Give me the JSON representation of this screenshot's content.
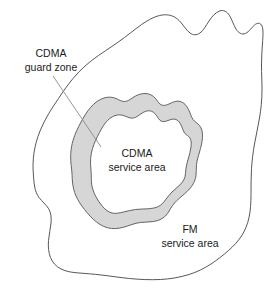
{
  "diagram": {
    "type": "concentric-region-map",
    "colors": {
      "background": "#ffffff",
      "outline_stroke": "#444444",
      "guard_zone_fill": "#d6d6d6",
      "guard_zone_stroke": "#555555",
      "service_area_fill": "#ffffff",
      "leader_line": "#888888",
      "text": "#1a1a1a"
    },
    "labels": {
      "guard_zone": {
        "line1": "CDMA",
        "line2": "guard zone"
      },
      "cdma_service_area": {
        "line1": "CDMA",
        "line2": "service area"
      },
      "fm_service_area": {
        "line1": "FM",
        "line2": "service area"
      }
    },
    "regions": [
      {
        "name": "fm-service-area",
        "label": "FM service area",
        "fill": "#ffffff",
        "description": "Outer irregular blob region"
      },
      {
        "name": "cdma-guard-zone",
        "label": "CDMA guard zone",
        "fill": "#d6d6d6",
        "description": "Gray annular band between outer blob and inner region"
      },
      {
        "name": "cdma-service-area",
        "label": "CDMA service area",
        "fill": "#ffffff",
        "description": "Innermost irregular region"
      }
    ]
  }
}
